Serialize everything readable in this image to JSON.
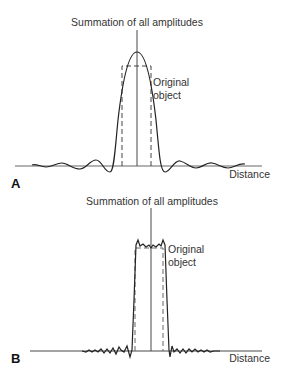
{
  "figure": {
    "panel_a": {
      "letter": "A",
      "title": "Summation of all amplitudes",
      "object_label_line1": "Original",
      "object_label_line2": "object",
      "axis_label": "Distance"
    },
    "panel_b": {
      "letter": "B",
      "title": "Summation of all amplitudes",
      "object_label_line1": "Original",
      "object_label_line2": "object",
      "axis_label": "Distance"
    },
    "colors": {
      "line": "#222222",
      "dashed": "#444444",
      "background": "#ffffff"
    }
  }
}
